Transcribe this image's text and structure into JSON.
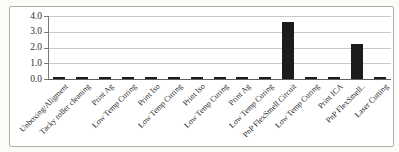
{
  "chart_data": {
    "type": "bar",
    "title": "",
    "xlabel": "",
    "ylabel": "",
    "categories": [
      "Unboxing/Aligment",
      "Tacky roller cleaning",
      "Print Ag",
      "Low Temp Curing",
      "Print Iso",
      "Low Temp Curing",
      "Print Iso",
      "Low Temp Curing",
      "Print Ag",
      "Low Temp Curing",
      "PnP FlexSmell Circuit",
      "Low Temp Curing",
      "Print ICA",
      "PnP FlexSmell..",
      "Laser Cutting"
    ],
    "values": [
      0.1,
      0.1,
      0.1,
      0.1,
      0.1,
      0.1,
      0.1,
      0.1,
      0.1,
      0.1,
      3.6,
      0.1,
      0.1,
      2.2,
      0.1
    ],
    "ylim": [
      0,
      4
    ],
    "ytick_step": 1,
    "ytick_labels": [
      "0.0",
      "1.0",
      "2.0",
      "3.0",
      "4.0"
    ],
    "grid": true,
    "legend": "none",
    "x_label_rotation_deg": 45
  },
  "colors": {
    "bar": "#1c1c1c",
    "gridline": "#c9c9c9",
    "axis": "#7a7a7a",
    "baseline": "#5f5f5f",
    "frame_border": "#aeaeae",
    "text": "#2a2a2a"
  }
}
